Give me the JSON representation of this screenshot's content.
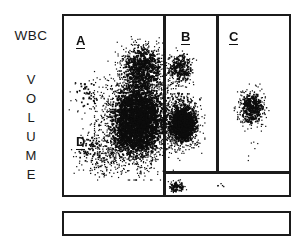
{
  "axis": {
    "y_title_top": "WBC",
    "y_title_letters": [
      "V",
      "O",
      "L",
      "U",
      "M",
      "E"
    ]
  },
  "regions": [
    {
      "id": "A",
      "label": "A"
    },
    {
      "id": "B",
      "label": "B"
    },
    {
      "id": "C",
      "label": "C"
    },
    {
      "id": "D",
      "label": "D"
    }
  ],
  "colors": {
    "frame": "#1b1b1b",
    "dots": "#0d0d0d",
    "background": "#ffffff"
  },
  "chart_data": {
    "type": "scatter",
    "title": "",
    "xlabel": "",
    "ylabel": "WBC VOLUME",
    "grid": false,
    "legend": "none",
    "xlim": [
      0,
      229
    ],
    "ylim": [
      0,
      183
    ],
    "gates": [
      {
        "name": "A",
        "x": 0,
        "y": 0,
        "width": 101,
        "height": 183,
        "label_x": 12,
        "label_y": 18
      },
      {
        "name": "B",
        "x": 101,
        "y": 0,
        "width": 53,
        "height": 158,
        "label_x": 117,
        "label_y": 14
      },
      {
        "name": "C",
        "x": 154,
        "y": 0,
        "width": 75,
        "height": 158,
        "label_x": 165,
        "label_y": 14
      },
      {
        "name": "D",
        "x": 0,
        "y": 0,
        "width": 101,
        "height": 183,
        "label_x": 12,
        "label_y": 119
      },
      {
        "name": "bottom-strip",
        "x": 101,
        "y": 158,
        "width": 128,
        "height": 25,
        "label_x": null,
        "label_y": null
      }
    ],
    "clusters": [
      {
        "name": "main-lymphocyte-cluster",
        "cx": 72,
        "cy": 104,
        "rx": 34,
        "ry": 48,
        "count": 2600,
        "density": "very-high"
      },
      {
        "name": "upper-neutrophil-cluster",
        "cx": 78,
        "cy": 52,
        "rx": 22,
        "ry": 26,
        "count": 900,
        "density": "high"
      },
      {
        "name": "region-b-cluster",
        "cx": 118,
        "cy": 107,
        "rx": 18,
        "ry": 24,
        "count": 1100,
        "density": "very-high"
      },
      {
        "name": "region-b-upper-cluster",
        "cx": 116,
        "cy": 52,
        "rx": 13,
        "ry": 17,
        "count": 260,
        "density": "medium"
      },
      {
        "name": "region-c-cluster",
        "cx": 187,
        "cy": 91,
        "rx": 14,
        "ry": 19,
        "count": 430,
        "density": "high"
      },
      {
        "name": "bottom-strip-cluster",
        "cx": 112,
        "cy": 170,
        "rx": 8,
        "ry": 6,
        "count": 90,
        "density": "medium"
      },
      {
        "name": "region-d-sparse",
        "cx": 24,
        "cy": 132,
        "rx": 16,
        "ry": 16,
        "count": 60,
        "density": "low"
      },
      {
        "name": "region-a-sparse",
        "cx": 22,
        "cy": 78,
        "rx": 14,
        "ry": 16,
        "count": 40,
        "density": "low"
      }
    ],
    "total_events": 5500
  }
}
